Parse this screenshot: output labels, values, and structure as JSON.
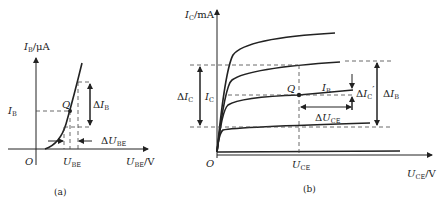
{
  "panel_a": {
    "caption": "(a)",
    "y_axis": {
      "symbol": "I",
      "sub": "B",
      "unit": "/μA"
    },
    "x_axis": {
      "symbol": "U",
      "sub": "BE",
      "unit": "/V"
    },
    "origin": "O",
    "q_label": "Q",
    "ib_label": {
      "symbol": "I",
      "sub": "B"
    },
    "ube_label": {
      "symbol": "U",
      "sub": "BE"
    },
    "delta_ib": {
      "prefix": "Δ",
      "symbol": "I",
      "sub": "B"
    },
    "delta_ube": {
      "prefix": "Δ",
      "symbol": "U",
      "sub": "BE"
    }
  },
  "panel_b": {
    "caption": "(b)",
    "y_axis": {
      "symbol": "I",
      "sub": "C",
      "unit": "/mA"
    },
    "x_axis": {
      "symbol": "U",
      "sub": "CE",
      "unit": "/V"
    },
    "origin": "O",
    "q_label": "Q",
    "ic_label": {
      "symbol": "I",
      "sub": "C"
    },
    "delta_ic": {
      "prefix": "Δ",
      "symbol": "I",
      "sub": "C"
    },
    "ib_curve_label": {
      "symbol": "I",
      "sub": "B"
    },
    "delta_ic_prime": {
      "prefix": "Δ",
      "symbol": "I",
      "sub": "C",
      "mark": "′"
    },
    "delta_uce": {
      "prefix": "Δ",
      "symbol": "U",
      "sub": "CE"
    },
    "delta_ib": {
      "prefix": "Δ",
      "symbol": "I",
      "sub": "B"
    },
    "uce_label": {
      "symbol": "U",
      "sub": "CE"
    }
  }
}
